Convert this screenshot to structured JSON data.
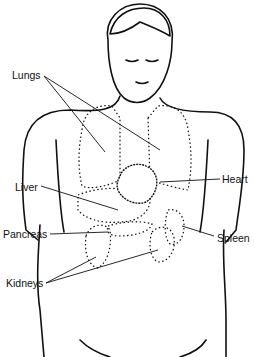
{
  "diagram": {
    "labels": [
      {
        "id": "lungs",
        "text": "Lungs",
        "x": 12,
        "y": 73
      },
      {
        "id": "liver",
        "text": "Liver",
        "x": 15,
        "y": 182
      },
      {
        "id": "heart",
        "text": "Heart",
        "x": 222,
        "y": 176
      },
      {
        "id": "pancreas",
        "text": "Pancreas",
        "x": 3,
        "y": 231
      },
      {
        "id": "spleen",
        "text": "Spleen",
        "x": 217,
        "y": 234
      },
      {
        "id": "kidneys",
        "text": "Kidneys",
        "x": 6,
        "y": 279
      }
    ]
  }
}
